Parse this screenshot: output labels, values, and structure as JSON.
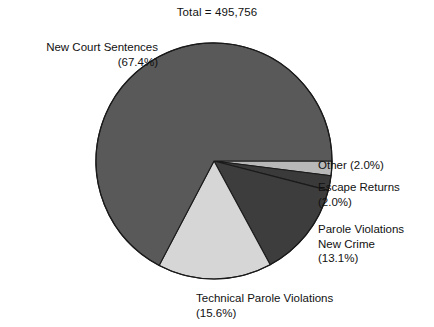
{
  "chart_data": {
    "type": "pie",
    "title": "Total = 495,756",
    "total": 495756,
    "xlabel": "",
    "ylabel": "",
    "legend": "none",
    "grid": false,
    "labels_inline": true,
    "start_angle_deg": 0,
    "direction": "clockwise",
    "categories": [
      "Other",
      "Escape Returns",
      "Parole Violations New Crime",
      "Technical Parole Violations",
      "New Court Sentences"
    ],
    "values": [
      2.0,
      2.0,
      13.1,
      15.6,
      67.4
    ],
    "slices": [
      {
        "name": "Other",
        "label": "Other (2.0%)",
        "percent": 2.0,
        "color": "#b8b8b8",
        "start_deg": 0,
        "end_deg": 7.2
      },
      {
        "name": "Escape Returns",
        "label": "Escape Returns\n(2.0%)",
        "percent": 2.0,
        "color": "#3a3a3a",
        "start_deg": 7.2,
        "end_deg": 14.4
      },
      {
        "name": "Parole Violations New Crime",
        "label": "Parole Violations\nNew Crime\n(13.1%)",
        "percent": 13.1,
        "color": "#3d3d3d",
        "start_deg": 14.4,
        "end_deg": 61.56
      },
      {
        "name": "Technical Parole Violations",
        "label": "Technical Parole Violations\n(15.6%)",
        "percent": 15.6,
        "color": "#d6d6d6",
        "start_deg": 61.56,
        "end_deg": 117.72
      },
      {
        "name": "New Court Sentences",
        "label": "New Court Sentences\n(67.4%)",
        "percent": 67.4,
        "color": "#595959",
        "start_deg": 117.72,
        "end_deg": 360
      }
    ],
    "geometry": {
      "center_x": 214,
      "center_y": 161,
      "radius": 118
    },
    "colors": {
      "outline": "#1a1a1a",
      "background": "#ffffff",
      "text": "#111111"
    }
  }
}
